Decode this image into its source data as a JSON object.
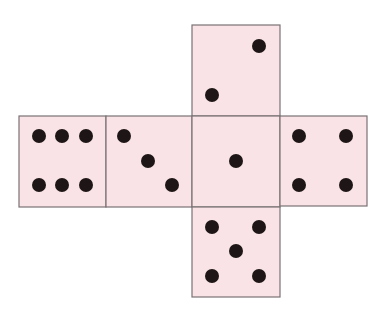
{
  "colors": {
    "face_fill": "#f9e3e6",
    "face_stroke": "#7a7274",
    "pip": "#1e1616"
  },
  "faces": [
    {
      "name": "top",
      "value": 2,
      "x": 192,
      "y": 25,
      "w": 88,
      "h": 91,
      "pips": [
        [
          259,
          46
        ],
        [
          212,
          95
        ]
      ]
    },
    {
      "name": "left-outer",
      "value": 6,
      "x": 19,
      "y": 116,
      "w": 87,
      "h": 91,
      "pips": [
        [
          39,
          136
        ],
        [
          62,
          136
        ],
        [
          86,
          136
        ],
        [
          39,
          185
        ],
        [
          62,
          185
        ],
        [
          86,
          185
        ]
      ]
    },
    {
      "name": "left-inner",
      "value": 3,
      "x": 106,
      "y": 116,
      "w": 86,
      "h": 91,
      "pips": [
        [
          124,
          136
        ],
        [
          148,
          161
        ],
        [
          172,
          185
        ]
      ]
    },
    {
      "name": "center",
      "value": 1,
      "x": 192,
      "y": 116,
      "w": 88,
      "h": 91,
      "pips": [
        [
          236,
          161
        ]
      ]
    },
    {
      "name": "right",
      "value": 4,
      "x": 280,
      "y": 116,
      "w": 87,
      "h": 90,
      "pips": [
        [
          299,
          136
        ],
        [
          346,
          136
        ],
        [
          299,
          185
        ],
        [
          346,
          185
        ]
      ]
    },
    {
      "name": "bottom",
      "value": 5,
      "x": 192,
      "y": 207,
      "w": 88,
      "h": 90,
      "pips": [
        [
          212,
          227
        ],
        [
          259,
          227
        ],
        [
          236,
          251
        ],
        [
          212,
          276
        ],
        [
          259,
          276
        ]
      ]
    }
  ],
  "pip_radius": 7
}
